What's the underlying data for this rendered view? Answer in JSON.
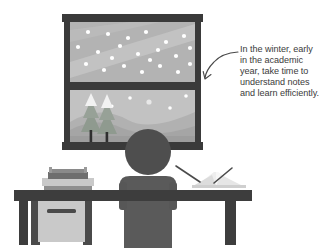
{
  "illustration": {
    "title": "Student studying at a desk by a snowy winter window",
    "background_color": "#ffffff"
  },
  "annotation": {
    "name": "callout-text",
    "text": "In the winter, early in the academic year, take time to understand notes and learn efficiently.",
    "lines": [
      "In the winter, early",
      "in the academic",
      "year, take time to",
      "understand notes",
      "and learn efficiently."
    ],
    "text_color": "#3b3b3b",
    "pointer": "curved-arrow-pointing-to-window"
  },
  "window": {
    "name": "window",
    "frame_color": "#3a3a3a",
    "upper_pane": {
      "name": "upper-pane-night-sky",
      "sky_color": "#b4b4b4",
      "light_band_color": "#c6c6c6",
      "snowflake_color": "#ffffff",
      "snowflake_count": 22
    },
    "lower_pane": {
      "name": "lower-pane-landscape",
      "sky_color": "#c3c3c3",
      "hill_far_color": "#b0b0b0",
      "hill_near_color": "#a6a6a6",
      "ground_color": "#9d9d9d",
      "moon_color": "#e8e8e8",
      "trees": [
        {
          "name": "pine-tree-left",
          "foliage_color": "#8e9a8e",
          "snow_cap_color": "#f2f2f2",
          "trunk_color": "#2f2f2f"
        },
        {
          "name": "pine-tree-right",
          "foliage_color": "#8e9a8e",
          "snow_cap_color": "#f2f2f2",
          "trunk_color": "#2f2f2f"
        }
      ],
      "snowflake_count": 4
    }
  },
  "desk": {
    "name": "desk",
    "top_color": "#3d3d3d",
    "leg_color": "#3d3d3d"
  },
  "printer": {
    "name": "printer",
    "body_color": "#c9c9c9",
    "top_color": "#6e6e6e",
    "shadow_color": "#8f8f8f"
  },
  "cabinet": {
    "name": "cabinet",
    "body_color": "#c9c9c9",
    "side_color": "#4a4a4a",
    "handle_color": "#4a4a4a"
  },
  "book": {
    "name": "open-book",
    "page_color": "#f5f5f5",
    "page_shade_color": "#d8d8d8",
    "pen_color": "#4a4a4a"
  },
  "person": {
    "name": "person-silhouette",
    "head_color": "#4e4e4e",
    "body_color": "#5a5a5a",
    "chair_color": "#565656"
  },
  "colors": {
    "ink": "#3b3b3b",
    "dark": "#3a3a3a",
    "mid_grey": "#8f8f8f",
    "light_grey": "#c9c9c9"
  }
}
